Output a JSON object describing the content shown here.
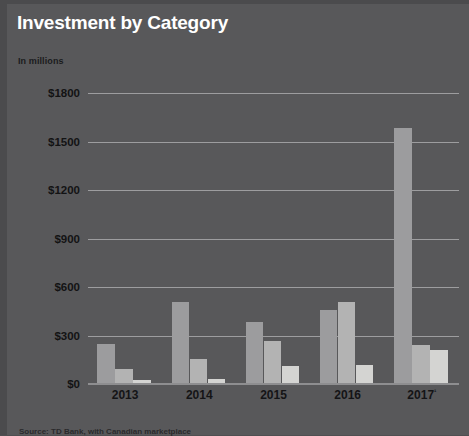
{
  "chart_data": {
    "type": "bar",
    "title": "Investment by Category",
    "subtitle": "In millions",
    "xlabel": "",
    "ylabel": "",
    "categories": [
      "2013",
      "2014",
      "2015",
      "2016",
      "2017¹"
    ],
    "series": [
      {
        "name": "series-1",
        "color": "#9c9c9e",
        "values": [
          245,
          505,
          385,
          455,
          1585
        ]
      },
      {
        "name": "series-2",
        "color": "#b3b3b3",
        "values": [
          95,
          155,
          265,
          505,
          240
        ]
      },
      {
        "name": "series-3",
        "color": "#d4d4d2",
        "values": [
          25,
          30,
          110,
          120,
          210
        ]
      }
    ],
    "ylim": [
      0,
      1800
    ],
    "ytick_values": [
      0,
      300,
      600,
      900,
      1200,
      1500,
      1800
    ],
    "ytick_labels": [
      "$0",
      "$300",
      "$600",
      "$900",
      "$1200",
      "$1500",
      "$1800"
    ],
    "grid": true,
    "legend": "none",
    "footnote_marker": "¹"
  },
  "header": {
    "title": "Investment by Category",
    "subtitle": "In millions"
  },
  "footer": {
    "source": "Source: TD Bank, with Canadian marketplace"
  },
  "colors": {
    "background": "#58585a",
    "title": "#ffffff",
    "label": "#131314",
    "gridline": "#9d9d9f"
  }
}
